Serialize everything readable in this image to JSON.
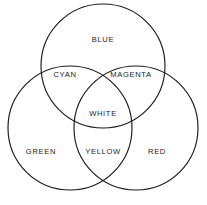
{
  "diagram": {
    "type": "venn-3-circle",
    "background_color": "#ffffff",
    "stroke_color": "#1a1a1a",
    "stroke_width": 1.15,
    "circles": [
      {
        "name": "blue-circle",
        "label": "BLUE",
        "cx": 103,
        "cy": 66,
        "r": 62
      },
      {
        "name": "green-circle",
        "label": "GREEN",
        "cx": 70,
        "cy": 128,
        "r": 62
      },
      {
        "name": "red-circle",
        "label": "RED",
        "cx": 136,
        "cy": 128,
        "r": 62
      }
    ],
    "labels": [
      {
        "id": "blue",
        "text": "BLUE",
        "x": 103,
        "y": 40,
        "region": "blue-only"
      },
      {
        "id": "cyan",
        "text": "CYAN",
        "x": 65,
        "y": 75,
        "region": "blue-green"
      },
      {
        "id": "magenta",
        "text": "MAGENTA",
        "x": 131,
        "y": 75,
        "region": "blue-red"
      },
      {
        "id": "white",
        "text": "WHITE",
        "x": 103,
        "y": 114,
        "region": "blue-green-red"
      },
      {
        "id": "green",
        "text": "GREEN",
        "x": 41,
        "y": 152,
        "region": "green-only"
      },
      {
        "id": "yellow",
        "text": "YELLOW",
        "x": 103,
        "y": 152,
        "region": "green-red"
      },
      {
        "id": "red",
        "text": "RED",
        "x": 157,
        "y": 152,
        "region": "red-only"
      }
    ]
  }
}
